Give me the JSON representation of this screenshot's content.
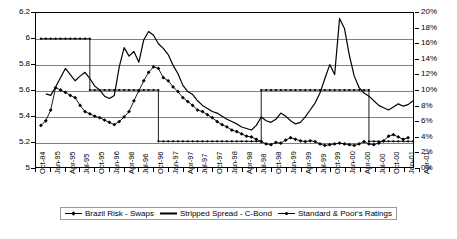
{
  "chart_data": {
    "type": "line",
    "title": "",
    "subtitle": "",
    "xlabel": "",
    "ylabel": "",
    "y2label": "",
    "grid": true,
    "legend_position": "bottom",
    "ylim": [
      5,
      6.2
    ],
    "y2lim": [
      0,
      0.2
    ],
    "y_ticks": [
      "5",
      "5.2",
      "5.4",
      "5.6",
      "5.8",
      "6",
      "6.2"
    ],
    "y_tick_values": [
      5,
      5.2,
      5.4,
      5.6,
      5.8,
      6,
      6.2
    ],
    "y2_ticks": [
      "0%",
      "2%",
      "4%",
      "6%",
      "8%",
      "10%",
      "12%",
      "14%",
      "16%",
      "18%",
      "20%"
    ],
    "y2_tick_values": [
      0,
      2,
      4,
      6,
      8,
      10,
      12,
      14,
      16,
      18,
      20
    ],
    "x_tick_labels": [
      "Oct-84",
      "Jan-95",
      "Apr-95",
      "Jul-95",
      "Oct-95",
      "Jan-96",
      "Apr-96",
      "Jul-96",
      "Oct-96",
      "Jan-97",
      "Apr-97",
      "Jul-97",
      "Oct-97",
      "Jan-98",
      "Apr-98",
      "Jul-98",
      "Oct-98",
      "Jan-99",
      "Apr-99",
      "Jul-99",
      "Oct-99",
      "Jan-00",
      "Apr-00",
      "Jul-00",
      "Oct-00",
      "Jan-01",
      "Apr-01"
    ],
    "x_count": 27,
    "series": [
      {
        "name": "Brazil Risk - Swaps",
        "axis": "right",
        "marker": "diamond",
        "line": "solid",
        "values": [
          null,
          5.4,
          6.0,
          7.4,
          10.3,
          10.0,
          9.7,
          9.3,
          9.0,
          8.0,
          7.2,
          6.9,
          6.6,
          6.4,
          6.1,
          5.8,
          5.5,
          5.9,
          6.5,
          7.2,
          8.6,
          9.9,
          11.2,
          12.3,
          13.0,
          12.8,
          11.6,
          11.2,
          10.4,
          9.8,
          9.0,
          8.5,
          8.0,
          7.4,
          7.2,
          6.8,
          6.4,
          5.9,
          5.5,
          5.2,
          4.8,
          4.6,
          4.3,
          4.0,
          3.9,
          3.6,
          3.3,
          3.0,
          2.9,
          3.2,
          3.1,
          3.5,
          3.8,
          3.6,
          3.4,
          3.3,
          3.4,
          3.3,
          3.0,
          2.8,
          2.9,
          3.0,
          3.1,
          3.0,
          2.9,
          2.8,
          3.0,
          3.3,
          3.0,
          2.9,
          3.1,
          3.4,
          4.0,
          4.2,
          3.9,
          3.6,
          3.8
        ],
        "first_value_label": "5.4",
        "last_value_label": "3.8"
      },
      {
        "name": "Stripped Spread - C-Bond",
        "axis": "right",
        "marker": "none",
        "line": "solid",
        "values": [
          null,
          null,
          9.5,
          9.3,
          10.4,
          11.6,
          12.8,
          12.0,
          11.2,
          11.8,
          12.3,
          11.5,
          10.5,
          10.0,
          9.2,
          8.9,
          9.3,
          13.0,
          15.5,
          14.4,
          15.0,
          13.6,
          16.5,
          17.6,
          17.1,
          16.0,
          15.4,
          14.6,
          13.2,
          12.1,
          10.6,
          9.8,
          9.4,
          8.6,
          8.0,
          7.6,
          7.2,
          7.0,
          6.6,
          6.2,
          5.9,
          5.6,
          5.2,
          5.0,
          4.8,
          5.4,
          6.5,
          6.0,
          5.8,
          6.2,
          7.0,
          6.6,
          6.0,
          5.6,
          5.8,
          6.5,
          7.4,
          8.3,
          9.6,
          11.5,
          13.3,
          12.0,
          19.3,
          18.0,
          14.5,
          11.8,
          10.3,
          9.6,
          9.2,
          8.6,
          8.0,
          7.7,
          7.4,
          7.8,
          8.2,
          7.9,
          8.1,
          8.6
        ],
        "peak_label": "19%",
        "peak_at": "Jan-99"
      },
      {
        "name": "Standard & Poor's Ratings",
        "axis": "left",
        "marker": "dot",
        "line": "dotted-step",
        "steps": [
          {
            "from_index": 1,
            "to_index": 11,
            "value": 6.0
          },
          {
            "from_index": 11,
            "to_index": 25,
            "value": 5.6
          },
          {
            "from_index": 25,
            "to_index": 46,
            "value": 5.2
          },
          {
            "from_index": 46,
            "to_index": 68,
            "value": 5.6
          },
          {
            "from_index": 68,
            "to_index": 77,
            "value": 5.2
          }
        ]
      }
    ]
  },
  "legend": {
    "items": [
      {
        "label": "Brazil Risk - Swaps",
        "marker": "line-with-diamond",
        "color": "#000000"
      },
      {
        "label": "Stripped Spread - C-Bond",
        "marker": "thick-line",
        "color": "#000000"
      },
      {
        "label": "Standard & Poor's Ratings",
        "marker": "line-with-dot",
        "color": "#000000"
      }
    ]
  },
  "colors": {
    "axis": "#000000",
    "grid": "#808080",
    "series": "#000000",
    "background": "#ffffff"
  }
}
